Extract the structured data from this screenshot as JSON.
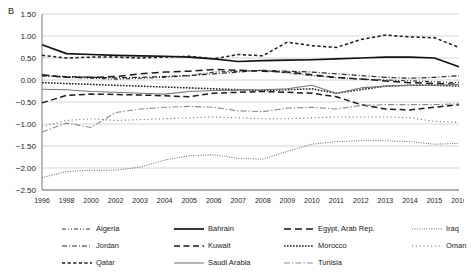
{
  "panel": {
    "label": "B"
  },
  "axes": {
    "y_ticks": [
      "1.50",
      "1.00",
      "0.50",
      "0.00",
      "-0.50",
      "-1.00",
      "-1.50",
      "-2.00",
      "-2.50"
    ],
    "x_ticks": [
      "1996",
      "1998",
      "2000",
      "2002",
      "2003",
      "2004",
      "2005",
      "2006",
      "2007",
      "2008",
      "2009",
      "2010",
      "2011",
      "2012",
      "2013",
      "2014",
      "2015",
      "2016"
    ]
  },
  "legend": {
    "entries": [
      {
        "label": "Algeria",
        "style": "dash-dot-dot"
      },
      {
        "label": "Bahrain",
        "style": "solid-thick"
      },
      {
        "label": "Egypt, Arab Rep.",
        "style": "long-dash"
      },
      {
        "label": "Iraq",
        "style": "fine-dotted"
      },
      {
        "label": "Jordan",
        "style": "dash-dot"
      },
      {
        "label": "Kuwait",
        "style": "dashed"
      },
      {
        "label": "Morocco",
        "style": "dotted-bold"
      },
      {
        "label": "Oman",
        "style": "sparse-dotted"
      },
      {
        "label": "Qatar",
        "style": "short-dash"
      },
      {
        "label": "Saudi Arabia",
        "style": "solid-thin"
      },
      {
        "label": "Tunisia",
        "style": "dash-dot-long"
      }
    ]
  },
  "chart_data": {
    "type": "line",
    "title": "",
    "xlabel": "",
    "ylabel": "",
    "ylim": [
      -2.5,
      1.5
    ],
    "ygrid": true,
    "legend_position": "bottom",
    "x": [
      "1996",
      "1998",
      "2000",
      "2002",
      "2003",
      "2004",
      "2005",
      "2006",
      "2007",
      "2008",
      "2009",
      "2010",
      "2011",
      "2012",
      "2013",
      "2014",
      "2015",
      "2016"
    ],
    "series": [
      {
        "name": "Algeria",
        "color": "#2b2b2b",
        "dash": "4,2,1,2,1,2",
        "width": 1.1,
        "values": [
          0.1,
          0.06,
          0.04,
          0.02,
          0.04,
          0.06,
          0.1,
          0.18,
          0.2,
          0.22,
          0.16,
          0.1,
          0.05,
          0.02,
          0.0,
          -0.02,
          -0.04,
          -0.06
        ]
      },
      {
        "name": "Bahrain",
        "color": "#111111",
        "dash": "",
        "width": 1.7,
        "values": [
          0.8,
          0.6,
          0.58,
          0.56,
          0.55,
          0.54,
          0.52,
          0.48,
          0.42,
          0.44,
          0.45,
          0.46,
          0.48,
          0.5,
          0.52,
          0.52,
          0.5,
          0.3
        ]
      },
      {
        "name": "Egypt, Arab Rep.",
        "color": "#1a1a1a",
        "dash": "7,4",
        "width": 1.5,
        "values": [
          0.12,
          0.06,
          0.06,
          0.08,
          0.14,
          0.18,
          0.2,
          0.24,
          0.22,
          0.2,
          0.18,
          0.12,
          0.06,
          0.02,
          -0.02,
          -0.06,
          -0.08,
          -0.1
        ]
      },
      {
        "name": "Iraq",
        "color": "#666666",
        "dash": "1,1.4",
        "width": 1.0,
        "values": [
          -2.22,
          -2.08,
          -2.05,
          -2.05,
          -1.98,
          -1.82,
          -1.72,
          -1.7,
          -1.78,
          -1.8,
          -1.62,
          -1.46,
          -1.4,
          -1.38,
          -1.38,
          -1.4,
          -1.46,
          -1.44
        ]
      },
      {
        "name": "Jordan",
        "color": "#262626",
        "dash": "5,2,1,2",
        "width": 1.2,
        "values": [
          0.1,
          0.08,
          0.06,
          0.05,
          0.06,
          0.08,
          0.1,
          0.14,
          0.18,
          0.22,
          0.2,
          0.18,
          0.14,
          0.1,
          0.06,
          0.04,
          0.06,
          0.1
        ]
      },
      {
        "name": "Kuwait",
        "color": "#1a1a1a",
        "dash": "6,3.5",
        "width": 1.5,
        "values": [
          -0.52,
          -0.35,
          -0.32,
          -0.33,
          -0.34,
          -0.36,
          -0.38,
          -0.3,
          -0.28,
          -0.26,
          -0.28,
          -0.3,
          -0.38,
          -0.56,
          -0.66,
          -0.68,
          -0.62,
          -0.56
        ]
      },
      {
        "name": "Morocco",
        "color": "#1a1a1a",
        "dash": "1.6,1.4",
        "width": 1.5,
        "values": [
          -0.06,
          -0.08,
          -0.1,
          -0.12,
          -0.14,
          -0.16,
          -0.18,
          -0.2,
          -0.22,
          -0.24,
          -0.22,
          -0.2,
          -0.3,
          -0.22,
          -0.14,
          -0.12,
          -0.12,
          -0.14
        ]
      },
      {
        "name": "Oman",
        "color": "#7a7a7a",
        "dash": "1.2,2.6",
        "width": 1.1,
        "values": [
          -1.06,
          -0.92,
          -0.88,
          -0.92,
          -0.9,
          -0.88,
          -0.86,
          -0.84,
          -0.86,
          -0.88,
          -0.88,
          -0.86,
          -0.84,
          -0.84,
          -0.84,
          -0.86,
          -0.94,
          -0.96
        ]
      },
      {
        "name": "Qatar",
        "color": "#1a1a1a",
        "dash": "3.2,2.4",
        "width": 1.5,
        "values": [
          0.56,
          0.5,
          0.52,
          0.52,
          0.5,
          0.52,
          0.54,
          0.48,
          0.58,
          0.55,
          0.86,
          0.78,
          0.74,
          0.92,
          1.02,
          0.98,
          0.96,
          0.74
        ]
      },
      {
        "name": "Saudi Arabia",
        "color": "#777777",
        "dash": "",
        "width": 1.1,
        "values": [
          -0.21,
          -0.22,
          -0.26,
          -0.28,
          -0.3,
          -0.32,
          -0.26,
          -0.24,
          -0.23,
          -0.22,
          -0.2,
          -0.12,
          -0.3,
          -0.18,
          -0.14,
          -0.12,
          -0.12,
          -0.1
        ]
      },
      {
        "name": "Tunisia",
        "color": "#8a8a8a",
        "dash": "6,2,1.4,2",
        "width": 1.1,
        "values": [
          -1.18,
          -0.98,
          -1.08,
          -0.74,
          -0.66,
          -0.62,
          -0.6,
          -0.62,
          -0.7,
          -0.72,
          -0.64,
          -0.62,
          -0.66,
          -0.58,
          -0.56,
          -0.56,
          -0.56,
          -0.54
        ]
      }
    ]
  }
}
